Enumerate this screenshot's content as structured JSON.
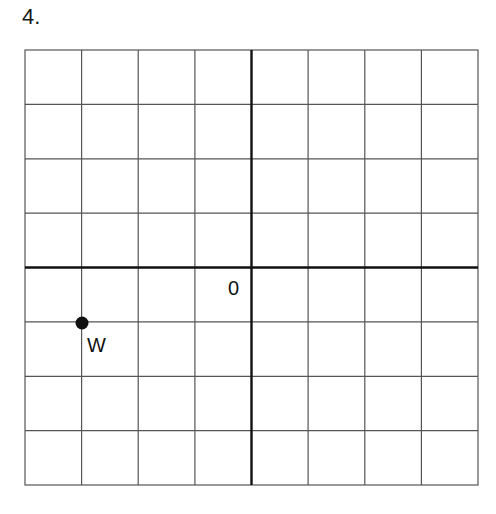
{
  "question": {
    "number": "4."
  },
  "grid": {
    "columns": 8,
    "rows": 8,
    "origin_label": "0",
    "x_range": [
      -4,
      4
    ],
    "y_range": [
      -4,
      4
    ],
    "line_color": "#555555",
    "axis_color": "#111111"
  },
  "points": [
    {
      "label": "W",
      "x": -3,
      "y": -1
    }
  ]
}
